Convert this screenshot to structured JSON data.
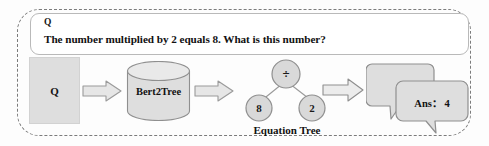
{
  "figure": {
    "type": "pipeline-diagram",
    "colors": {
      "border_dashed": "#7b7b7b",
      "shape_fill": "#dedede",
      "shape_stroke": "#9a9a9a",
      "panel_border": "#b9b9b9",
      "text": "#111111",
      "background": "#ffffff"
    }
  },
  "question_panel": {
    "tag": "Q",
    "text": "The number multiplied by 2 equals 8. What is this number?"
  },
  "pipeline": {
    "input_block": {
      "label": "Q"
    },
    "model": {
      "label": "Bert2Tree",
      "shape": "cylinder"
    },
    "tree": {
      "caption": "Equation Tree",
      "root": "÷",
      "left_child": "8",
      "right_child": "2"
    },
    "output": {
      "answer_label": "Ans： 4"
    },
    "arrows": [
      {
        "name": "arrow-input-to-model"
      },
      {
        "name": "arrow-model-to-tree"
      },
      {
        "name": "arrow-tree-to-answer"
      }
    ]
  }
}
